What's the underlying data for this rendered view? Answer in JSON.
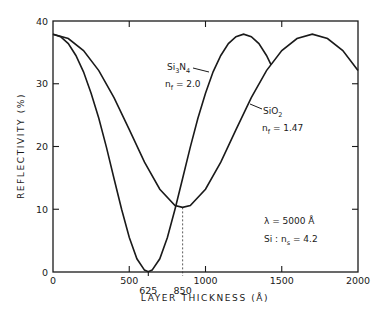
{
  "chart_data": {
    "type": "line",
    "title": "",
    "xlabel": "LAYER THICKNESS (Å)",
    "ylabel": "REFLECTIVITY (%)",
    "xlim": [
      0,
      2000
    ],
    "ylim": [
      0,
      40
    ],
    "grid": false,
    "x_ticks": [
      {
        "value": 0,
        "label": "0"
      },
      {
        "value": 500,
        "label": "500"
      },
      {
        "value": 625,
        "label": "625"
      },
      {
        "value": 850,
        "label": "850"
      },
      {
        "value": 1000,
        "label": "1000"
      },
      {
        "value": 1500,
        "label": "1500"
      },
      {
        "value": 2000,
        "label": "2000"
      }
    ],
    "y_ticks": [
      {
        "value": 0,
        "label": "0"
      },
      {
        "value": 10,
        "label": "10"
      },
      {
        "value": 20,
        "label": "20"
      },
      {
        "value": 30,
        "label": "30"
      },
      {
        "value": 40,
        "label": "40"
      }
    ],
    "series": [
      {
        "name": "Si3N4 (nf = 2.0)",
        "label_main": "Si",
        "label_sub1": "3",
        "label_mid": "N",
        "label_sub2": "4",
        "index_label": "n",
        "index_sub": "f",
        "index_value": " = 2.0",
        "x": [
          0,
          50,
          100,
          150,
          200,
          250,
          300,
          350,
          400,
          450,
          500,
          550,
          600,
          625,
          650,
          700,
          750,
          800,
          850,
          900,
          950,
          1000,
          1050,
          1100,
          1150,
          1200,
          1250,
          1300,
          1350,
          1400,
          1430
        ],
        "y": [
          37.9,
          37.5,
          36.4,
          34.5,
          31.9,
          28.5,
          24.5,
          19.9,
          14.9,
          10.0,
          5.5,
          2.1,
          0.3,
          0.05,
          0.3,
          2.1,
          5.5,
          10.0,
          14.9,
          19.9,
          24.5,
          28.5,
          31.9,
          34.5,
          36.4,
          37.5,
          37.9,
          37.5,
          36.4,
          34.5,
          33.0
        ]
      },
      {
        "name": "SiO2 (nf = 1.47)",
        "label_main": "SiO",
        "label_sub1": "2",
        "index_label": "n",
        "index_sub": "f",
        "index_value": " = 1.47",
        "x": [
          0,
          100,
          200,
          300,
          400,
          500,
          600,
          700,
          800,
          850,
          900,
          1000,
          1100,
          1200,
          1300,
          1400,
          1500,
          1600,
          1700,
          1800,
          1900,
          2000
        ],
        "y": [
          37.9,
          37.2,
          35.3,
          32.1,
          27.8,
          22.7,
          17.5,
          13.2,
          10.6,
          10.3,
          10.6,
          13.2,
          17.5,
          22.7,
          27.8,
          32.1,
          35.3,
          37.2,
          37.9,
          37.2,
          35.3,
          32.1
        ]
      }
    ],
    "annotations": {
      "wavelength_symbol": "λ",
      "wavelength_value": " = 5000 Å",
      "substrate_label": "Si : n",
      "substrate_sub": "s",
      "substrate_value": " = 4.2",
      "dashed_marker_x": 850,
      "dashed_marker_y": 10.3
    }
  }
}
